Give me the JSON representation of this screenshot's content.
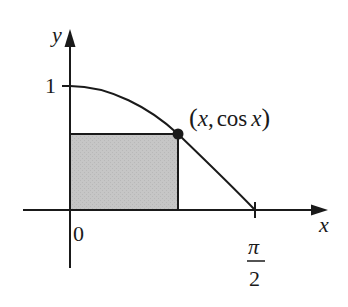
{
  "diagram": {
    "axes": {
      "x_label": "x",
      "y_label": "y",
      "origin_label": "0",
      "y_tick_label": "1",
      "x_tick_label_numerator": "π",
      "x_tick_label_denominator": "2"
    },
    "point_label_open": "(",
    "point_label_x": "x",
    "point_label_comma": ",",
    "point_label_cos": "cos",
    "point_label_x2": "x",
    "point_label_close": ")",
    "colors": {
      "stroke": "#1a1a1a",
      "rectangle_fill": "#c4c4c4"
    }
  }
}
